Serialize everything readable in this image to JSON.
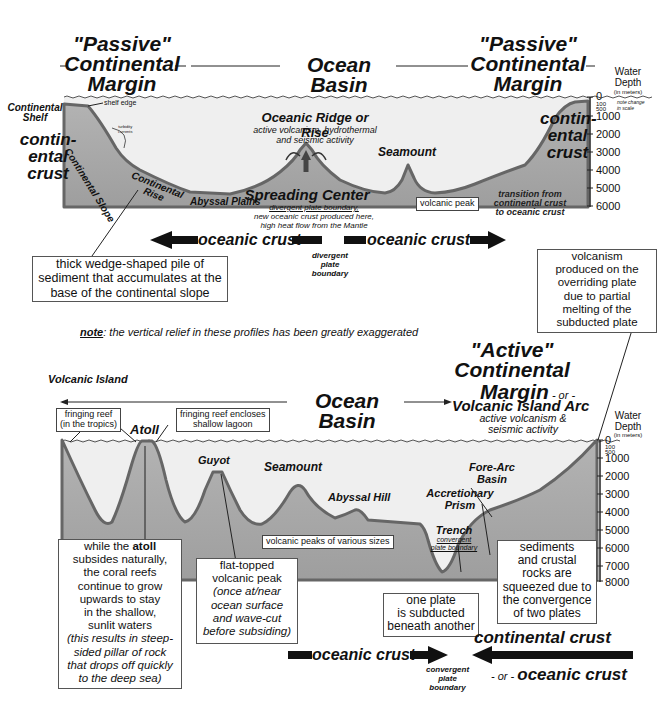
{
  "colors": {
    "sea": "#efefef",
    "crust": "#a8a8a8",
    "outline": "#6b6b6b",
    "text": "#111111",
    "box_border": "#555555"
  },
  "top_profile": {
    "headers": {
      "left_margin": [
        "\"Passive\"",
        "Continental",
        "Margin"
      ],
      "center": "Ocean Basin",
      "right_margin": [
        "\"Passive\"",
        "Continental",
        "Margin"
      ]
    },
    "depth_axis": {
      "title": [
        "Water",
        "Depth",
        "(in meters)"
      ],
      "ticks": [
        "0",
        "100",
        "500",
        "1000",
        "2000",
        "3000",
        "4000",
        "5000",
        "6000"
      ],
      "scale_note": [
        "note change",
        "in scale"
      ]
    },
    "labels": {
      "continental_shelf": [
        "Continental",
        "Shelf"
      ],
      "shelf_edge": "shelf edge",
      "turbidity_currents": [
        "turbidity",
        "currents"
      ],
      "continental_crust_left": [
        "contin-",
        "ental",
        "crust"
      ],
      "continental_slope": "Continental Slope",
      "continental_rise": [
        "Continental",
        "Rise"
      ],
      "abyssal_plains": "Abyssal Plains",
      "oceanic_ridge_title": "Oceanic Ridge or Rise",
      "oceanic_ridge_desc": [
        "active volcanism, hydrothermal",
        "and seismic activity"
      ],
      "spreading_center_title": "Spreading Center",
      "spreading_center_desc": [
        "divergent plate boundary,",
        "new oceanic crust produced here,",
        "high heat flow from the Mantle"
      ],
      "seamount": "Seamount",
      "volcanic_peak": "volcanic peak",
      "continental_crust_right": [
        "contin-",
        "ental",
        "crust"
      ],
      "transition": [
        "transition from",
        "continental crust",
        "to oceanic crust"
      ]
    },
    "arrows": {
      "left_crust": "oceanic crust",
      "right_crust": "oceanic crust",
      "boundary": [
        "divergent",
        "plate",
        "boundary"
      ]
    },
    "callout_sediment": [
      "thick wedge-shaped pile of",
      "sediment that accumulates at the",
      "base of the continental slope"
    ]
  },
  "note": {
    "prefix": "note",
    "text": ": the vertical relief in these profiles has been greatly exaggerated"
  },
  "callout_volcanism": [
    "volcanism",
    "produced on the",
    "overriding plate",
    "due to partial",
    "melting of the",
    "subducted plate"
  ],
  "bottom_profile": {
    "headers": {
      "volcanic_island": "Volcanic Island",
      "center": "Ocean Basin",
      "active_margin": [
        "\"Active\"",
        "Continental"
      ],
      "active_margin_line3": "Margin",
      "or1": " - or -",
      "arc": "Volcanic Island Arc",
      "arc_desc": [
        "active volcanism &",
        "seismic activity"
      ]
    },
    "depth_axis": {
      "title": [
        "Water",
        "Depth",
        "(in meters)"
      ],
      "ticks": [
        "0",
        "100",
        "500",
        "1000",
        "2000",
        "3000",
        "4000",
        "5000",
        "6000",
        "7000",
        "8000"
      ]
    },
    "labels": {
      "fringing_reef": [
        "fringing reef",
        "(in the tropics)"
      ],
      "atoll": "Atoll",
      "fringing_lagoon": [
        "fringing reef encloses",
        "shallow lagoon"
      ],
      "guyot": "Guyot",
      "seamount": "Seamount",
      "abyssal_hill": "Abyssal Hill",
      "volcanic_peaks": "volcanic peaks of various sizes",
      "accretionary_prism": [
        "Accretionary",
        "Prism"
      ],
      "fore_arc_basin": [
        "Fore-Arc",
        "Basin"
      ],
      "trench": "Trench",
      "trench_desc": [
        "convergent",
        "plate boundary"
      ]
    },
    "callout_atoll": {
      "line1_pre": "while the ",
      "line1_bold": "atoll",
      "lines": [
        "subsides naturally,",
        "the coral reefs",
        "continue to grow",
        "upwards to stay",
        "in the shallow,",
        "sunlit waters"
      ],
      "italic_lines": [
        "(this results in steep-",
        "sided pillar of rock",
        "that drops off quickly",
        "to the deep sea)"
      ]
    },
    "callout_guyot": {
      "lines": [
        "flat-topped",
        "volcanic peak"
      ],
      "italic_lines": [
        "(once at/near",
        "ocean surface",
        "and wave-cut",
        "before subsiding)"
      ]
    },
    "callout_subduction": [
      "one plate",
      "is subducted",
      "beneath another"
    ],
    "callout_squeeze": [
      "sediments",
      "and crustal",
      "rocks are",
      "squeezed due to",
      "the convergence",
      "of two plates"
    ],
    "arrows": {
      "left_crust": "oceanic crust",
      "boundary": [
        "convergent",
        "plate",
        "boundary"
      ],
      "right_top": "continental crust",
      "or2": "- or - ",
      "right_bottom": "oceanic crust"
    }
  }
}
